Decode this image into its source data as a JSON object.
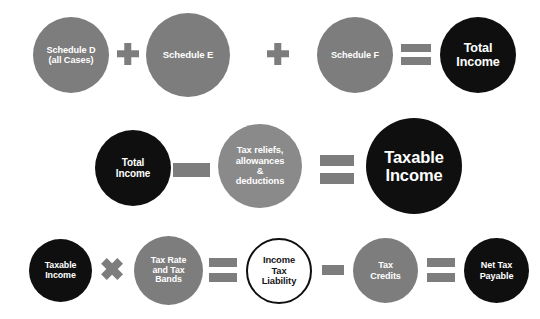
{
  "diagram": {
    "type": "formula-flow",
    "background_color": "#ffffff",
    "colors": {
      "gray": "#7d7d7d",
      "gray_light": "#8a8a8a",
      "black": "#0f0f0f",
      "white": "#ffffff"
    },
    "rows": [
      {
        "id": "row-total-income",
        "formula": "Schedule D (all Cases) + Schedule E + Schedule F = Total Income",
        "nodes": [
          {
            "id": "schedule-d",
            "lines": [
              "Schedule D",
              "(all Cases)"
            ],
            "style": "gray"
          },
          {
            "id": "schedule-e",
            "lines": [
              "Schedule E"
            ],
            "style": "gray"
          },
          {
            "id": "schedule-f",
            "lines": [
              "Schedule F"
            ],
            "style": "gray"
          },
          {
            "id": "total-income-result",
            "lines": [
              "Total",
              "Income"
            ],
            "style": "black"
          }
        ],
        "operators": [
          {
            "id": "plus-1",
            "symbol": "+",
            "name": "plus"
          },
          {
            "id": "plus-2",
            "symbol": "+",
            "name": "plus"
          },
          {
            "id": "equals-1",
            "symbol": "=",
            "name": "equals"
          }
        ]
      },
      {
        "id": "row-taxable-income",
        "formula": "Total Income - Tax reliefs, allowances & deductions = Taxable Income",
        "nodes": [
          {
            "id": "total-income",
            "lines": [
              "Total",
              "Income"
            ],
            "style": "black"
          },
          {
            "id": "tax-reliefs",
            "lines": [
              "Tax reliefs,",
              "allowances",
              "&",
              "deductions"
            ],
            "style": "gray-light"
          },
          {
            "id": "taxable-income-result",
            "lines": [
              "Taxable",
              "Income"
            ],
            "style": "black"
          }
        ],
        "operators": [
          {
            "id": "minus-1",
            "symbol": "−",
            "name": "minus"
          },
          {
            "id": "equals-2",
            "symbol": "=",
            "name": "equals"
          }
        ]
      },
      {
        "id": "row-net-tax-payable",
        "formula": "Taxable Income x Tax Rate and Tax Bands = Income Tax Liability - Tax Credits = Net Tax Payable",
        "nodes": [
          {
            "id": "taxable-income",
            "lines": [
              "Taxable",
              "Income"
            ],
            "style": "black"
          },
          {
            "id": "tax-rate-bands",
            "lines": [
              "Tax Rate",
              "and Tax",
              "Bands"
            ],
            "style": "gray"
          },
          {
            "id": "income-tax-liability",
            "lines": [
              "Income",
              "Tax",
              "Liability"
            ],
            "style": "outline"
          },
          {
            "id": "tax-credits",
            "lines": [
              "Tax",
              "Credits"
            ],
            "style": "gray"
          },
          {
            "id": "net-tax-payable",
            "lines": [
              "Net Tax",
              "Payable"
            ],
            "style": "black"
          }
        ],
        "operators": [
          {
            "id": "times-1",
            "symbol": "×",
            "name": "multiply"
          },
          {
            "id": "equals-3",
            "symbol": "=",
            "name": "equals"
          },
          {
            "id": "minus-2",
            "symbol": "−",
            "name": "minus"
          },
          {
            "id": "equals-4",
            "symbol": "=",
            "name": "equals"
          }
        ]
      }
    ]
  }
}
